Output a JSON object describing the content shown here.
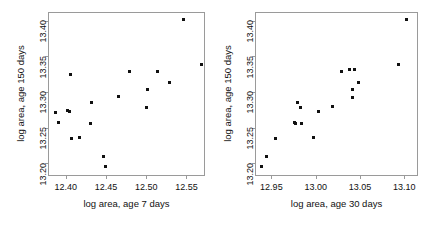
{
  "figure": {
    "type": "scatter-matrix",
    "panel_count": 2,
    "background": "#ffffff",
    "point_color": "#111111",
    "frame_color": "#9a9a9a"
  },
  "chart_data": [
    {
      "type": "scatter",
      "title": "",
      "xlabel": "log area, age 7 days",
      "ylabel": "log area, age 150 days",
      "xlim": [
        12.378,
        12.573
      ],
      "ylim": [
        13.182,
        13.412
      ],
      "xticks": [
        12.4,
        12.45,
        12.5,
        12.55
      ],
      "xticklabels": [
        "12.40",
        "12.45",
        "12.50",
        "12.55"
      ],
      "yticks": [
        13.2,
        13.25,
        13.3,
        13.35,
        13.4
      ],
      "yticklabels": [
        "13.20",
        "13.25",
        "13.30",
        "13.35",
        "13.40"
      ],
      "grid": false,
      "legend": null,
      "n_points": 19,
      "points": [
        {
          "x": 12.3875,
          "y": 13.2715
        },
        {
          "x": 12.3905,
          "y": 13.2565
        },
        {
          "x": 12.4045,
          "y": 13.273
        },
        {
          "x": 12.406,
          "y": 13.324
        },
        {
          "x": 12.407,
          "y": 13.2345
        },
        {
          "x": 12.4175,
          "y": 13.236
        },
        {
          "x": 12.431,
          "y": 13.2555
        },
        {
          "x": 12.4325,
          "y": 13.285
        },
        {
          "x": 12.4465,
          "y": 13.2095
        },
        {
          "x": 12.449,
          "y": 13.195
        },
        {
          "x": 12.465,
          "y": 13.2935
        },
        {
          "x": 12.479,
          "y": 13.328
        },
        {
          "x": 12.5,
          "y": 13.2775
        },
        {
          "x": 12.5015,
          "y": 13.3035
        },
        {
          "x": 12.5145,
          "y": 13.3285
        },
        {
          "x": 12.529,
          "y": 13.313
        },
        {
          "x": 12.546,
          "y": 13.402
        },
        {
          "x": 12.569,
          "y": 13.339
        },
        {
          "x": 12.402,
          "y": 13.2735
        }
      ]
    },
    {
      "type": "scatter",
      "title": "",
      "xlabel": "log area, age 30 days",
      "ylabel": "log area, age 150 days",
      "xlim": [
        12.9315,
        13.1155
      ],
      "ylim": [
        13.182,
        13.412
      ],
      "xticks": [
        12.95,
        13.0,
        13.05,
        13.1
      ],
      "xticklabels": [
        "12.95",
        "13.00",
        "13.05",
        "13.10"
      ],
      "yticks": [
        13.2,
        13.25,
        13.3,
        13.35,
        13.4
      ],
      "yticklabels": [
        "13.20",
        "13.25",
        "13.30",
        "13.35",
        "13.40"
      ],
      "grid": false,
      "legend": null,
      "n_points": 19,
      "points": [
        {
          "x": 12.939,
          "y": 13.195
        },
        {
          "x": 12.945,
          "y": 13.2095
        },
        {
          "x": 12.955,
          "y": 13.2345
        },
        {
          "x": 12.9765,
          "y": 13.2565
        },
        {
          "x": 12.98,
          "y": 13.285
        },
        {
          "x": 12.983,
          "y": 13.2775
        },
        {
          "x": 12.9845,
          "y": 13.2555
        },
        {
          "x": 12.998,
          "y": 13.236
        },
        {
          "x": 13.003,
          "y": 13.273
        },
        {
          "x": 13.0185,
          "y": 13.28
        },
        {
          "x": 13.029,
          "y": 13.328
        },
        {
          "x": 13.0385,
          "y": 13.331
        },
        {
          "x": 13.041,
          "y": 13.303
        },
        {
          "x": 13.042,
          "y": 13.2915
        },
        {
          "x": 13.044,
          "y": 13.331
        },
        {
          "x": 13.048,
          "y": 13.3135
        },
        {
          "x": 13.094,
          "y": 13.339
        },
        {
          "x": 13.103,
          "y": 13.402
        },
        {
          "x": 12.9775,
          "y": 13.256
        }
      ]
    }
  ]
}
